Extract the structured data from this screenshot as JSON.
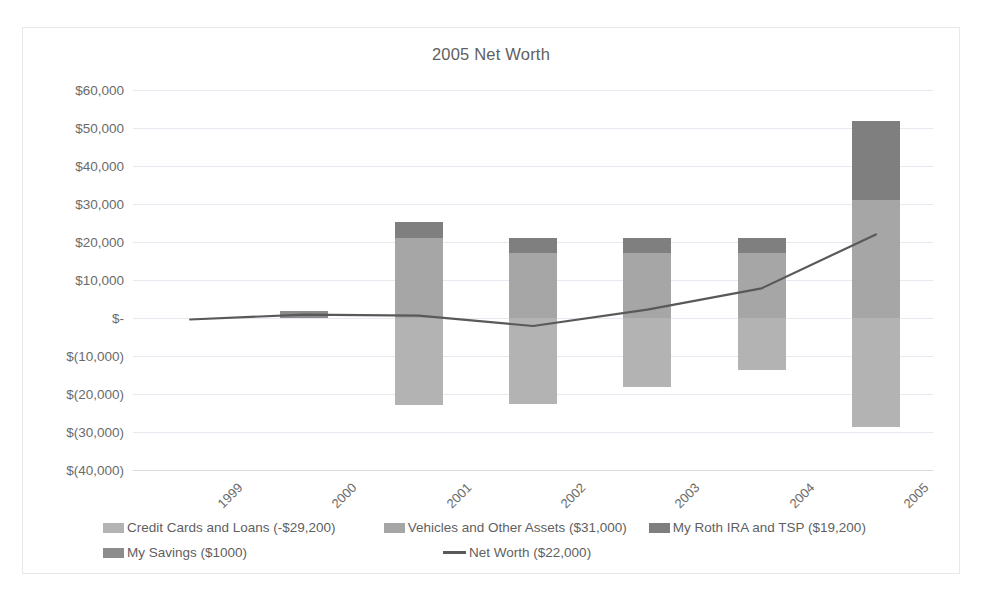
{
  "chart_data": {
    "type": "bar",
    "title": "2005 Net Worth",
    "xlabel": "",
    "ylabel": "",
    "categories": [
      "1999",
      "2000",
      "2001",
      "2002",
      "2003",
      "2004",
      "2005"
    ],
    "ylim": [
      -40000,
      60000
    ],
    "ytick_values": [
      60000,
      50000,
      40000,
      30000,
      20000,
      10000,
      0,
      -10000,
      -20000,
      -30000,
      -40000
    ],
    "ytick_labels": [
      "$60,000",
      "$50,000",
      "$40,000",
      "$30,000",
      "$20,000",
      "$10,000",
      "$-",
      "$(10,000)",
      "$(20,000)",
      "$(30,000)",
      "$(40,000)"
    ],
    "grid": true,
    "legend_position": "bottom",
    "stacked": true,
    "series": [
      {
        "name": "Credit Cards and Loans (-$29,200)",
        "type": "bar",
        "color": "#b3b3b3",
        "values": [
          0,
          0,
          -22800,
          -22500,
          -18200,
          -13600,
          -28800
        ]
      },
      {
        "name": "Vehicles and Other Assets ($31,000)",
        "type": "bar",
        "color": "#a6a6a6",
        "values": [
          0,
          0,
          21000,
          17000,
          17000,
          17000,
          31000
        ]
      },
      {
        "name": "My Roth IRA and TSP ($19,200)",
        "type": "bar",
        "color": "#7f7f7f",
        "values": [
          0,
          0,
          4200,
          4000,
          4000,
          4000,
          20800
        ]
      },
      {
        "name": "My Savings ($1000)",
        "type": "bar",
        "color": "#8c8c8c",
        "values": [
          0,
          1800,
          0,
          0,
          0,
          0,
          0
        ]
      },
      {
        "name": "Net Worth ($22,000)",
        "type": "line",
        "color": "#595959",
        "values": [
          -400,
          900,
          600,
          -2100,
          2200,
          7800,
          22000
        ]
      }
    ]
  },
  "legend": {
    "items": [
      {
        "label": "Credit Cards and Loans (-$29,200)",
        "marker": "swatch",
        "color": "#b3b3b3"
      },
      {
        "label": "Vehicles and Other Assets ($31,000)",
        "marker": "swatch",
        "color": "#a6a6a6"
      },
      {
        "label": "My Roth IRA and TSP ($19,200)",
        "marker": "swatch",
        "color": "#7f7f7f"
      },
      {
        "label": "My Savings ($1000)",
        "marker": "swatch",
        "color": "#8c8c8c"
      },
      {
        "label": "Net Worth ($22,000)",
        "marker": "line",
        "color": "#595959"
      }
    ]
  }
}
